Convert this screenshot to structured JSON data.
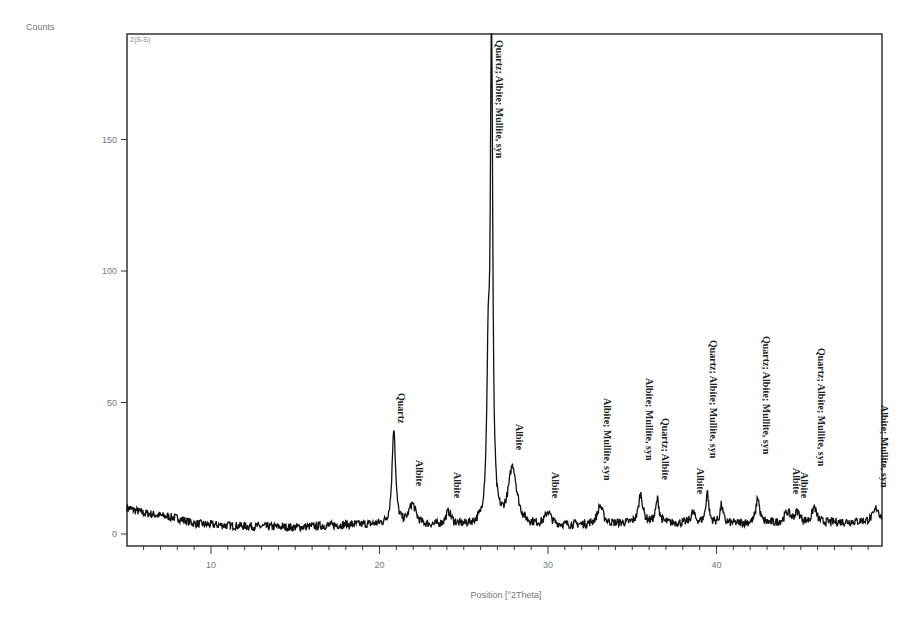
{
  "chart_data": {
    "type": "line",
    "title": "",
    "corner_label": "2(S-S)",
    "xlabel": "Position [°2Theta]",
    "ylabel": "Counts",
    "xlim": [
      5,
      50
    ],
    "ylim": [
      0,
      190
    ],
    "x_ticks": [
      10,
      20,
      30,
      40
    ],
    "x_minor_step": 1,
    "y_ticks": [
      0,
      50,
      100,
      150
    ],
    "grid": false,
    "legend": null,
    "baseline": [
      {
        "x": 5.0,
        "y": 10
      },
      {
        "x": 6.0,
        "y": 8
      },
      {
        "x": 7.0,
        "y": 7
      },
      {
        "x": 8.0,
        "y": 6
      },
      {
        "x": 9.0,
        "y": 4
      },
      {
        "x": 10.0,
        "y": 3.5
      },
      {
        "x": 12.0,
        "y": 3
      },
      {
        "x": 15.0,
        "y": 2.5
      },
      {
        "x": 18.0,
        "y": 3.5
      },
      {
        "x": 20.0,
        "y": 3.5
      },
      {
        "x": 22.0,
        "y": 3
      },
      {
        "x": 25.0,
        "y": 3
      },
      {
        "x": 30.0,
        "y": 3
      },
      {
        "x": 35.0,
        "y": 4
      },
      {
        "x": 40.0,
        "y": 4
      },
      {
        "x": 45.0,
        "y": 4
      },
      {
        "x": 50.0,
        "y": 5
      }
    ],
    "peaks": [
      {
        "x": 20.85,
        "height": 37,
        "width": 0.12,
        "label": "Quartz"
      },
      {
        "x": 21.95,
        "height": 8,
        "width": 0.25,
        "label": "Albite"
      },
      {
        "x": 24.1,
        "height": 5,
        "width": 0.2,
        "label": "Albite"
      },
      {
        "x": 26.45,
        "height": 55,
        "width": 0.1,
        "label": ""
      },
      {
        "x": 26.65,
        "height": 195,
        "width": 0.08,
        "label": "Quartz; Albite; Mullite, syn"
      },
      {
        "x": 27.9,
        "height": 22,
        "width": 0.3,
        "label": "Albite"
      },
      {
        "x": 30.0,
        "height": 5,
        "width": 0.2,
        "label": "Albite"
      },
      {
        "x": 33.1,
        "height": 7,
        "width": 0.2,
        "label": "Albite; Mullite, syn"
      },
      {
        "x": 35.5,
        "height": 11,
        "width": 0.15,
        "label": "Albite; Mullite, syn"
      },
      {
        "x": 36.5,
        "height": 9,
        "width": 0.12,
        "label": "Quartz; Albite"
      },
      {
        "x": 38.6,
        "height": 4,
        "width": 0.15,
        "label": "Albite"
      },
      {
        "x": 39.45,
        "height": 12,
        "width": 0.1,
        "label": "Quartz; Albite; Mullite, syn"
      },
      {
        "x": 40.3,
        "height": 7,
        "width": 0.1,
        "label": ""
      },
      {
        "x": 42.45,
        "height": 10,
        "width": 0.12,
        "label": "Quartz; Albite; Mullite, syn"
      },
      {
        "x": 44.2,
        "height": 4,
        "width": 0.2,
        "label": "Albite"
      },
      {
        "x": 44.8,
        "height": 4,
        "width": 0.2,
        "label": "Albite"
      },
      {
        "x": 45.8,
        "height": 6,
        "width": 0.15,
        "label": "Quartz; Albite; Mullite, syn"
      },
      {
        "x": 49.5,
        "height": 5,
        "width": 0.2,
        "label": "Albite; Mullite, syn"
      }
    ],
    "label_positions": [
      {
        "x": 20.85,
        "y_top": 393,
        "text": "Quartz"
      },
      {
        "x": 21.95,
        "y_top": 460,
        "text": "Albite"
      },
      {
        "x": 24.2,
        "y_top": 472,
        "text": "Albite"
      },
      {
        "x": 26.65,
        "y_top": 40,
        "text": "Quartz; Albite; Mullite, syn"
      },
      {
        "x": 27.85,
        "y_top": 424,
        "text": "Albite"
      },
      {
        "x": 30.0,
        "y_top": 472,
        "text": "Albite"
      },
      {
        "x": 33.1,
        "y_top": 398,
        "text": "Albite; Mullite, syn"
      },
      {
        "x": 35.6,
        "y_top": 378,
        "text": "Albite; Mullite, syn"
      },
      {
        "x": 36.5,
        "y_top": 418,
        "text": "Quartz; Albite"
      },
      {
        "x": 38.6,
        "y_top": 468,
        "text": "Albite"
      },
      {
        "x": 39.4,
        "y_top": 340,
        "text": "Quartz; Albite; Mullite, syn"
      },
      {
        "x": 42.5,
        "y_top": 336,
        "text": "Quartz; Albite; Mullite, syn"
      },
      {
        "x": 44.3,
        "y_top": 468,
        "text": "Albite"
      },
      {
        "x": 44.8,
        "y_top": 472,
        "text": "Albite"
      },
      {
        "x": 45.8,
        "y_top": 348,
        "text": "Quartz; Albite; Mullite, syn"
      },
      {
        "x": 49.5,
        "y_top": 405,
        "text": "Albite; Mullite, syn"
      }
    ],
    "noise_amplitude": 1.6,
    "colors": {
      "line": "#111111",
      "axis": "#333333",
      "text": "#777777"
    }
  }
}
